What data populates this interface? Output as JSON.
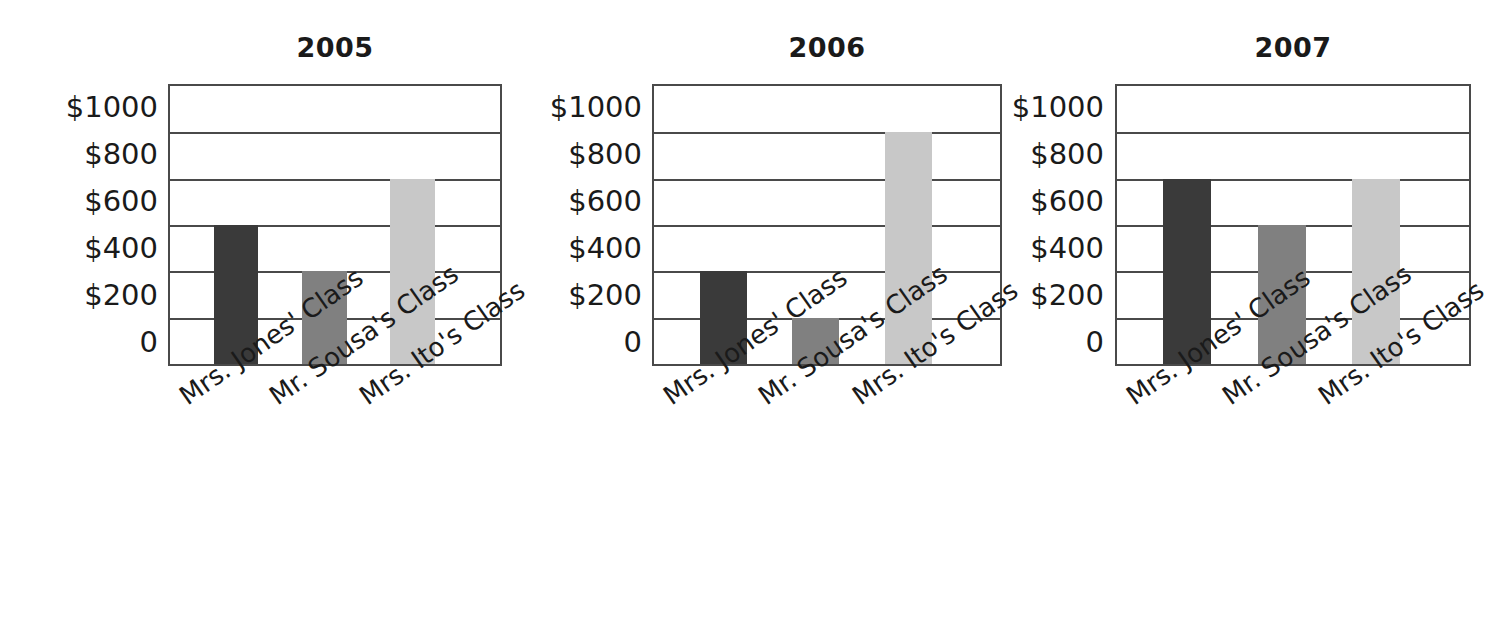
{
  "chart_data": [
    {
      "type": "bar",
      "title": "2005",
      "categories": [
        "Mrs. Jones' Class",
        "Mr. Sousa's Class",
        "Mrs. Ito's Class"
      ],
      "values": [
        600,
        400,
        800
      ],
      "xlabel": "",
      "ylabel": "",
      "ylim": [
        0,
        1000
      ],
      "ticks": [
        "$1000",
        "$800",
        "$600",
        "$400",
        "$200",
        "0"
      ],
      "tick_values": [
        1000,
        800,
        600,
        400,
        200,
        0
      ],
      "grid": true,
      "legend": "none",
      "bar_colors": [
        "#3a3a3a",
        "#808080",
        "#c8c8c8"
      ]
    },
    {
      "type": "bar",
      "title": "2006",
      "categories": [
        "Mrs. Jones' Class",
        "Mr. Sousa's Class",
        "Mrs. Ito's Class"
      ],
      "values": [
        400,
        200,
        1000
      ],
      "xlabel": "",
      "ylabel": "",
      "ylim": [
        0,
        1000
      ],
      "ticks": [
        "$1000",
        "$800",
        "$600",
        "$400",
        "$200",
        "0"
      ],
      "tick_values": [
        1000,
        800,
        600,
        400,
        200,
        0
      ],
      "grid": true,
      "legend": "none",
      "bar_colors": [
        "#3a3a3a",
        "#808080",
        "#c8c8c8"
      ]
    },
    {
      "type": "bar",
      "title": "2007",
      "categories": [
        "Mrs. Jones' Class",
        "Mr. Sousa's Class",
        "Mrs. Ito's Class"
      ],
      "values": [
        800,
        600,
        800
      ],
      "xlabel": "",
      "ylabel": "",
      "ylim": [
        0,
        1000
      ],
      "ticks": [
        "$1000",
        "$800",
        "$600",
        "$400",
        "$200",
        "0"
      ],
      "tick_values": [
        1000,
        800,
        600,
        400,
        200,
        0
      ],
      "grid": true,
      "legend": "none",
      "bar_colors": [
        "#3a3a3a",
        "#808080",
        "#c8c8c8"
      ]
    }
  ],
  "style": {
    "axis_color": "#4a4a4a",
    "text_color": "#1a1a1a",
    "background": "#ffffff",
    "label_rotation_deg": -35
  }
}
